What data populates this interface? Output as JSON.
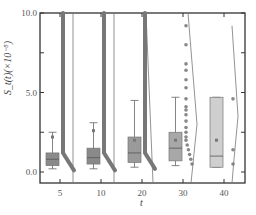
{
  "chart_data": {
    "type": "box-violin",
    "title": "",
    "xlabel": "t",
    "ylabel": "S_t(t)(×10^-5)",
    "ylim": [
      0.0,
      10.0
    ],
    "yticks": [
      "0.0",
      "5.0",
      "10.0"
    ],
    "categories": [
      "5",
      "10",
      "20",
      "30",
      "40"
    ],
    "series": [
      {
        "name": "5",
        "whisker_low": 0.2,
        "q1": 0.4,
        "median": 0.8,
        "q3": 1.2,
        "whisker_high": 2.5,
        "mean": 2.2,
        "box_color": "#8a8a8a",
        "outliers_dense": true,
        "outlier_range": [
          0.1,
          10.0
        ]
      },
      {
        "name": "10",
        "whisker_low": 0.2,
        "q1": 0.5,
        "median": 0.9,
        "q3": 1.5,
        "whisker_high": 3.1,
        "mean": 2.6,
        "box_color": "#8a8a8a",
        "outliers_dense": true,
        "outlier_range": [
          0.1,
          10.0
        ]
      },
      {
        "name": "20",
        "whisker_low": 0.3,
        "q1": 0.6,
        "median": 1.2,
        "q3": 2.2,
        "whisker_high": 4.5,
        "mean": 2.0,
        "box_color": "#9a9a9a",
        "outliers_dense": true,
        "outlier_range": [
          0.2,
          10.0
        ]
      },
      {
        "name": "30",
        "whisker_low": 0.4,
        "q1": 0.7,
        "median": 1.5,
        "q3": 2.5,
        "whisker_high": 4.7,
        "mean": 2.0,
        "box_color": "#a8a8a8",
        "outliers": [
          0.5,
          0.8,
          1.1,
          1.4,
          1.7,
          2.0,
          2.2,
          2.5,
          2.8,
          3.2,
          3.6,
          3.9,
          4.1,
          4.6,
          5.3,
          5.8,
          6.4,
          6.8,
          8.0,
          9.2
        ]
      },
      {
        "name": "40",
        "whisker_low": 0.3,
        "q1": 0.3,
        "median": 1.0,
        "q3": 4.7,
        "whisker_high": 4.7,
        "mean": 2.0,
        "box_color": "#cfcfcf",
        "outliers": [
          4.6,
          1.4,
          0.5
        ]
      }
    ],
    "grid": false,
    "legend": "none"
  },
  "axes": {
    "x_title": "t",
    "y_title": "S_t(t)(×10⁻⁵)",
    "y_tick_labels": [
      "0.0",
      "5.0",
      "10.0"
    ],
    "x_tick_labels": [
      "5",
      "10",
      "20",
      "30",
      "40"
    ]
  }
}
